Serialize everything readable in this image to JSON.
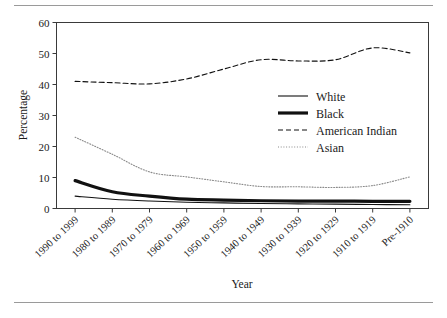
{
  "chart_data": {
    "type": "line",
    "title": "",
    "xlabel": "Year",
    "ylabel": "Percentage",
    "ylim": [
      0,
      60
    ],
    "yticks": [
      0,
      10,
      20,
      30,
      40,
      50,
      60
    ],
    "grid": false,
    "legend_position": "upper-center-right",
    "categories": [
      "1990 to 1999",
      "1980 to 1989",
      "1970 to 1979",
      "1960 to 1969",
      "1950 to 1959",
      "1940 to 1949",
      "1930 to 1939",
      "1920 to 1929",
      "1910 to 1919",
      "Pre-1910"
    ],
    "series": [
      {
        "name": "White",
        "style": "solid-thin",
        "color": "#111111",
        "values": [
          4.0,
          3.0,
          2.4,
          2.0,
          1.8,
          1.6,
          1.5,
          1.4,
          1.3,
          1.2
        ]
      },
      {
        "name": "Black",
        "style": "solid-thick",
        "color": "#111111",
        "values": [
          9.0,
          5.4,
          4.0,
          3.0,
          2.7,
          2.5,
          2.4,
          2.4,
          2.3,
          2.3
        ]
      },
      {
        "name": "American Indian",
        "style": "dashed",
        "color": "#111111",
        "values": [
          41.0,
          40.6,
          40.2,
          41.8,
          45.0,
          48.0,
          47.6,
          48.0,
          51.8,
          50.2
        ]
      },
      {
        "name": "Asian",
        "style": "dotted",
        "color": "#8a8a8a",
        "values": [
          23.0,
          17.5,
          11.8,
          10.2,
          8.6,
          7.1,
          7.0,
          6.8,
          7.4,
          10.2
        ]
      }
    ]
  },
  "axis": {
    "y_label": "Percentage",
    "x_label": "Year"
  },
  "legend": {
    "entries": [
      {
        "label": "White"
      },
      {
        "label": "Black"
      },
      {
        "label": "American Indian"
      },
      {
        "label": "Asian"
      }
    ]
  }
}
